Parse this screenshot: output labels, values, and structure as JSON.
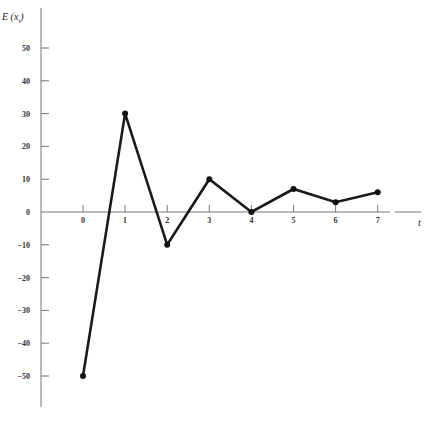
{
  "chart_data": {
    "type": "line",
    "title": "",
    "xlabel": "t",
    "ylabel": "E(x_t)",
    "ylabel_display": {
      "main": "E (x",
      "sub": "t",
      "close": ")"
    },
    "x": [
      0,
      1,
      2,
      3,
      4,
      5,
      6,
      7
    ],
    "series": [
      {
        "name": "E(x_t)",
        "values": [
          -50,
          30,
          -10,
          10,
          0,
          7,
          3,
          6
        ]
      }
    ],
    "x_ticks": [
      0,
      1,
      2,
      3,
      4,
      5,
      6,
      7
    ],
    "y_ticks": [
      50,
      40,
      30,
      20,
      10,
      0,
      -10,
      -20,
      -30,
      -40,
      -50
    ],
    "xlim": [
      -1,
      8
    ],
    "ylim": [
      -60,
      55
    ],
    "grid": false,
    "legend": null,
    "line_color": "#1a1a1a",
    "marker": "circle"
  }
}
